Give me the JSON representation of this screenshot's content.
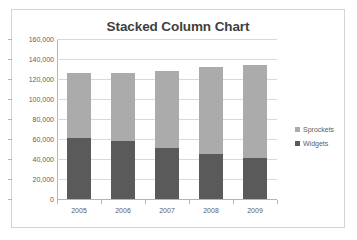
{
  "chart_data": {
    "type": "bar",
    "subtype": "stacked-column",
    "title": "Stacked Column Chart",
    "xlabel": "",
    "ylabel": "",
    "categories": [
      "2005",
      "2006",
      "2007",
      "2008",
      "2009"
    ],
    "series": [
      {
        "name": "Widgets",
        "color": "#5a5a5a",
        "values": [
          61000,
          58000,
          51000,
          45000,
          41000
        ]
      },
      {
        "name": "Sprockets",
        "color": "#ababab",
        "values": [
          65000,
          68000,
          77000,
          87000,
          93000
        ]
      }
    ],
    "stack_order": [
      "Widgets",
      "Sprockets"
    ],
    "totals": [
      126000,
      126000,
      128000,
      132000,
      134000
    ],
    "ylim": [
      0,
      160000
    ],
    "ytick_step": 20000,
    "ytick_labels": [
      "160,000",
      "140,000",
      "120,000",
      "100,000",
      "80,000",
      "60,000",
      "40,000",
      "20,000",
      "0"
    ],
    "ytick_values": [
      160000,
      140000,
      120000,
      100000,
      80000,
      60000,
      40000,
      20000,
      0
    ],
    "grid": {
      "horizontal": true,
      "vertical": false
    },
    "legend": {
      "position": "right",
      "entries": [
        {
          "label": "Sprockets",
          "color": "#ababab"
        },
        {
          "label": "Widgets",
          "color": "#5a5a5a"
        }
      ]
    }
  }
}
